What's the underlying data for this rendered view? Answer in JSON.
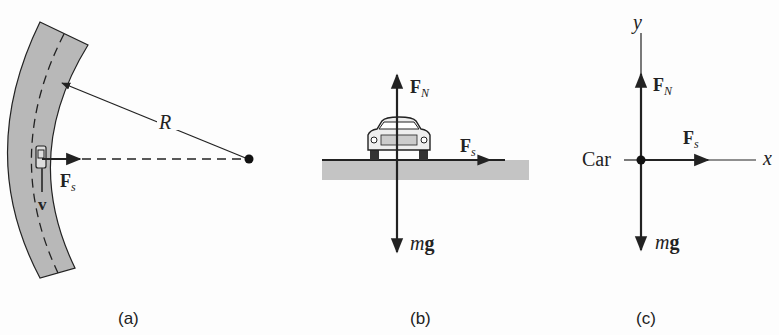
{
  "panels": {
    "a": {
      "caption": "(a)",
      "radius_label": "R",
      "force_label": "F",
      "force_sub": "s",
      "velocity_label": "v"
    },
    "b": {
      "caption": "(b)",
      "normal_label": "F",
      "normal_sub": "N",
      "friction_label": "F",
      "friction_sub": "s",
      "weight_label_m": "m",
      "weight_label_g": "g"
    },
    "c": {
      "caption": "(c)",
      "y_axis_label": "y",
      "x_axis_label": "x",
      "body_label": "Car",
      "normal_label": "F",
      "normal_sub": "N",
      "friction_label": "F",
      "friction_sub": "s",
      "weight_label_m": "m",
      "weight_label_g": "g"
    }
  },
  "colors": {
    "ink": "#222222",
    "road": "#b8b8b8",
    "ground": "#c4c4c4"
  }
}
